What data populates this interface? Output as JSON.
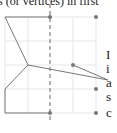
{
  "header_text": "s (or vertices) in first",
  "side_letters": [
    "I",
    "i",
    "a",
    "s",
    "c"
  ],
  "figure": {
    "grid_x": [
      5,
      28,
      50,
      73,
      96
    ],
    "grid_y": [
      17,
      41,
      65,
      89,
      113
    ],
    "dashed_line_x": 50,
    "polyline": [
      [
        50,
        17
      ],
      [
        5,
        17
      ],
      [
        28,
        65
      ],
      [
        5,
        89
      ],
      [
        5,
        113
      ],
      [
        50,
        113
      ]
    ],
    "pointer_lines": [
      [
        [
          28,
          65
        ],
        [
          108,
          80
        ]
      ],
      [
        [
          73,
          65
        ],
        [
          108,
          80
        ]
      ]
    ],
    "dots": [
      [
        50,
        17
      ],
      [
        96,
        17
      ],
      [
        73,
        65
      ],
      [
        96,
        89
      ],
      [
        50,
        113
      ],
      [
        96,
        113
      ]
    ],
    "colors": {
      "grid": "#e6e6e6",
      "line": "#777777",
      "dot": "#777777"
    }
  }
}
